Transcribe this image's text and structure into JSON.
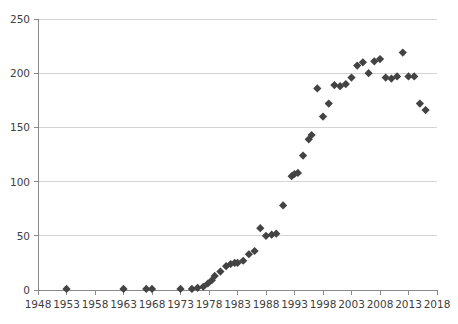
{
  "chart_data": {
    "type": "scatter",
    "title": "",
    "subtitle": "",
    "xlabel": "",
    "ylabel": "",
    "xlim": [
      1948,
      2018
    ],
    "ylim": [
      0,
      250
    ],
    "grid": true,
    "legend": null,
    "marker": "diamond",
    "marker_color": "#434343",
    "marker_size": 7,
    "xticks": [
      1948,
      1953,
      1958,
      1963,
      1968,
      1973,
      1978,
      1983,
      1988,
      1993,
      1998,
      2003,
      2008,
      2013,
      2018
    ],
    "xtick_labels": [
      "1948",
      "1953",
      "1958",
      "1963",
      "1968",
      "1973",
      "1978",
      "1983",
      "1988",
      "1993",
      "1998",
      "2003",
      "2008",
      "2013",
      "2018"
    ],
    "yticks": [
      0,
      50,
      100,
      150,
      200,
      250
    ],
    "ytick_labels": [
      "0",
      "50",
      "100",
      "150",
      "200",
      "250"
    ],
    "series": [
      {
        "name": "series-1",
        "points": [
          [
            1953,
            1
          ],
          [
            1963,
            1
          ],
          [
            1967,
            1
          ],
          [
            1968,
            1
          ],
          [
            1973,
            1
          ],
          [
            1975,
            1
          ],
          [
            1976,
            2
          ],
          [
            1977,
            3
          ],
          [
            1977.8,
            6
          ],
          [
            1978.5,
            9
          ],
          [
            1979,
            13
          ],
          [
            1980,
            17
          ],
          [
            1981,
            22
          ],
          [
            1981.8,
            24
          ],
          [
            1982.5,
            25
          ],
          [
            1983,
            25
          ],
          [
            1984,
            27
          ],
          [
            1985,
            33
          ],
          [
            1986,
            36
          ],
          [
            1987,
            57
          ],
          [
            1988,
            50
          ],
          [
            1989,
            51
          ],
          [
            1989.8,
            52
          ],
          [
            1991,
            78
          ],
          [
            1992.5,
            105
          ],
          [
            1993,
            107
          ],
          [
            1993.6,
            108
          ],
          [
            1994.5,
            124
          ],
          [
            1995.5,
            139
          ],
          [
            1996,
            143
          ],
          [
            1997,
            186
          ],
          [
            1998,
            160
          ],
          [
            1999,
            172
          ],
          [
            2000,
            189
          ],
          [
            2001,
            188
          ],
          [
            2002,
            190
          ],
          [
            2003,
            196
          ],
          [
            2004,
            207
          ],
          [
            2005,
            210
          ],
          [
            2006,
            200
          ],
          [
            2007,
            211
          ],
          [
            2008,
            213
          ],
          [
            2009,
            196
          ],
          [
            2010,
            195
          ],
          [
            2011,
            197
          ],
          [
            2012,
            219
          ],
          [
            2013,
            197
          ],
          [
            2014,
            197
          ],
          [
            2015,
            172
          ],
          [
            2016,
            166
          ]
        ]
      }
    ]
  }
}
